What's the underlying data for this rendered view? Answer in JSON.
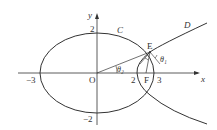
{
  "figure": {
    "axes": {
      "x_label": "x",
      "y_label": "y",
      "origin_label": "O",
      "ticks": {
        "x_neg3": "−3",
        "x_2": "2",
        "x_3": "3",
        "y_2": "2",
        "y_neg2": "−2"
      }
    },
    "curves": {
      "ellipse_label": "C",
      "hyperbola_label": "D"
    },
    "points": {
      "E": "E",
      "F": "F"
    },
    "angles": {
      "theta1": "θ₁",
      "theta2": "θ₂"
    },
    "colors": {
      "stroke": "#333333",
      "background": "#ffffff"
    }
  }
}
